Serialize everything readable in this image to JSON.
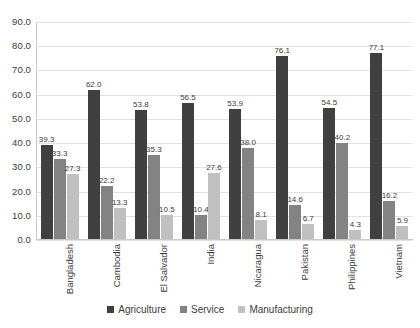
{
  "chart_data": {
    "type": "bar",
    "title": "",
    "subtitle": "",
    "xlabel": "",
    "ylabel": "",
    "ylim": [
      0,
      90
    ],
    "ytick_step": 10,
    "ytick_labels": [
      "90.0",
      "80.0",
      "70.0",
      "60.0",
      "50.0",
      "40.0",
      "30.0",
      "20.0",
      "10.0",
      "0.0"
    ],
    "ytick_values": [
      90,
      80,
      70,
      60,
      50,
      40,
      30,
      20,
      10,
      0
    ],
    "grid": true,
    "legend_position": "bottom",
    "categories": [
      "Bangladesh",
      "Cambodia",
      "El Salvador",
      "India",
      "Nicaragua",
      "Pakistan",
      "Philippines",
      "Vietnam"
    ],
    "series": [
      {
        "name": "Agriculture",
        "color": "#404040",
        "values": [
          39.3,
          62.0,
          53.8,
          56.5,
          53.9,
          76.1,
          54.5,
          77.1
        ],
        "labels": [
          "39.3",
          "62.0",
          "53.8",
          "56.5",
          "53.9",
          "76.1",
          "54.5",
          "77.1"
        ]
      },
      {
        "name": "Service",
        "color": "#838383",
        "values": [
          33.3,
          22.2,
          35.3,
          10.4,
          38.0,
          14.6,
          40.2,
          16.2
        ],
        "labels": [
          "33.3",
          "22.2",
          "35.3",
          "10.4",
          "38.0",
          "14.6",
          "40.2",
          "16.2"
        ]
      },
      {
        "name": "Manufacturing",
        "color": "#c0c0c0",
        "values": [
          27.3,
          13.3,
          10.5,
          27.6,
          8.1,
          6.7,
          4.3,
          5.9
        ],
        "labels": [
          "27.3",
          "13.3",
          "10.5",
          "27.6",
          "8.1",
          "6.7",
          "4.3",
          "5.9"
        ]
      }
    ]
  }
}
